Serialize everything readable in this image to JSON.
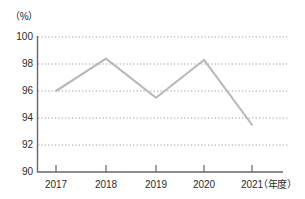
{
  "chart_data": {
    "type": "line",
    "title": "",
    "subtitle": "",
    "xlabel": "（年度）",
    "ylabel": "（%）",
    "unit_label": "（%）",
    "categories": [
      "2017",
      "2018",
      "2019",
      "2020",
      "2021"
    ],
    "values": [
      96.0,
      98.4,
      95.5,
      98.3,
      93.5
    ],
    "series": [
      {
        "name": "",
        "values": [
          96.0,
          98.4,
          95.5,
          98.3,
          93.5
        ]
      }
    ],
    "ylim": [
      90,
      100
    ],
    "yticks": [
      90,
      92,
      94,
      96,
      98,
      100
    ],
    "ytick_labels": [
      "90",
      "92",
      "94",
      "96",
      "98",
      "100"
    ],
    "xtick_labels": [
      "2017",
      "2018",
      "2019",
      "2020",
      "2021"
    ],
    "grid": true,
    "grid_style": "dotted-horizontal",
    "legend": false,
    "legend_position": "none",
    "markers": false,
    "line_color": "#b8b8b8",
    "grid_color": "#9a9a9a",
    "axis_color": "#555555",
    "text_color": "#2b2b2b",
    "background_color": "#ffffff"
  },
  "axes": {
    "y": {
      "unit": "（%）",
      "min": "90",
      "max": "100",
      "tick_labels": [
        "100",
        "98",
        "96",
        "94",
        "92",
        "90"
      ]
    },
    "x": {
      "title": "（年度）",
      "tick_labels": [
        "2017",
        "2018",
        "2019",
        "2020",
        "2021"
      ]
    }
  }
}
